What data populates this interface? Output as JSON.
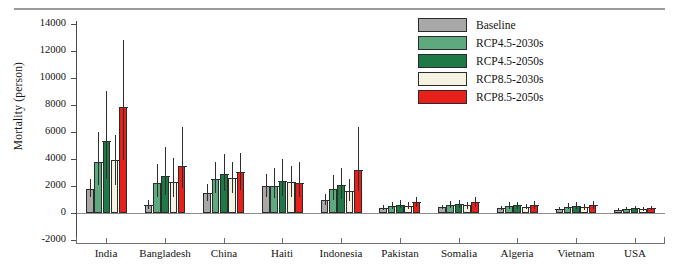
{
  "figure": {
    "ylabel": "Mortality (person)",
    "y_ticks": [
      14000,
      12000,
      10000,
      8000,
      6000,
      4000,
      2000,
      0,
      -2000
    ],
    "y_tick_labels": [
      "14000",
      "12000",
      "10000",
      "8000",
      "6000",
      "4000",
      "2000",
      "0",
      "-2000"
    ]
  },
  "legend": {
    "items": [
      {
        "label": "Baseline",
        "color": "#a8a8a8"
      },
      {
        "label": "RCP4.5-2030s",
        "color": "#5fa97f"
      },
      {
        "label": "RCP4.5-2050s",
        "color": "#1d7a44"
      },
      {
        "label": "RCP8.5-2030s",
        "color": "#f7f3e3"
      },
      {
        "label": "RCP8.5-2050s",
        "color": "#e8201a"
      }
    ]
  },
  "chart_data": {
    "type": "bar",
    "title": "",
    "xlabel": "",
    "ylabel": "Mortality (person)",
    "ylim": [
      -2000,
      14000
    ],
    "grid": false,
    "legend_position": "top-right",
    "error_bars": true,
    "categories": [
      "India",
      "Bangladesh",
      "China",
      "Haiti",
      "Indonesia",
      "Pakistan",
      "Somalia",
      "Algeria",
      "Vietnam",
      "USA"
    ],
    "series": [
      {
        "name": "Baseline",
        "color": "#a8a8a8",
        "values": [
          1750,
          600,
          1500,
          2000,
          950,
          400,
          420,
          350,
          300,
          230
        ],
        "err_low": [
          1150,
          330,
          900,
          1200,
          560,
          250,
          260,
          210,
          190,
          140
        ],
        "err_high": [
          2500,
          950,
          2150,
          2900,
          1400,
          600,
          600,
          520,
          450,
          340
        ]
      },
      {
        "name": "RCP4.5-2030s",
        "color": "#5fa97f",
        "values": [
          3750,
          2200,
          2500,
          2000,
          1750,
          550,
          600,
          520,
          480,
          330
        ],
        "err_low": [
          2050,
          1200,
          1450,
          1100,
          950,
          330,
          350,
          300,
          280,
          200
        ],
        "err_high": [
          6000,
          3600,
          3750,
          3300,
          2800,
          820,
          880,
          780,
          720,
          470
        ]
      },
      {
        "name": "RCP4.5-2050s",
        "color": "#1d7a44",
        "values": [
          5350,
          2750,
          2900,
          2400,
          2050,
          620,
          650,
          560,
          540,
          380
        ],
        "err_low": [
          2500,
          1350,
          1600,
          1250,
          1050,
          360,
          380,
          320,
          310,
          220
        ],
        "err_high": [
          9050,
          4900,
          4400,
          4000,
          3350,
          940,
          960,
          840,
          820,
          540
        ]
      },
      {
        "name": "RCP8.5-2030s",
        "color": "#f7f3e3",
        "values": [
          3950,
          2300,
          2600,
          2300,
          1600,
          520,
          560,
          470,
          430,
          300
        ],
        "err_low": [
          2100,
          1200,
          1500,
          1200,
          880,
          310,
          330,
          270,
          250,
          180
        ],
        "err_high": [
          5750,
          4050,
          3800,
          3500,
          2550,
          780,
          820,
          700,
          640,
          430
        ]
      },
      {
        "name": "RCP8.5-2050s",
        "color": "#e8201a",
        "values": [
          7850,
          3500,
          3050,
          2250,
          3150,
          800,
          780,
          600,
          580,
          350
        ],
        "err_low": [
          3950,
          1850,
          1700,
          1150,
          1600,
          430,
          430,
          330,
          320,
          200
        ],
        "err_high": [
          12850,
          6400,
          4450,
          3800,
          6400,
          1180,
          1150,
          900,
          870,
          510
        ]
      }
    ]
  }
}
